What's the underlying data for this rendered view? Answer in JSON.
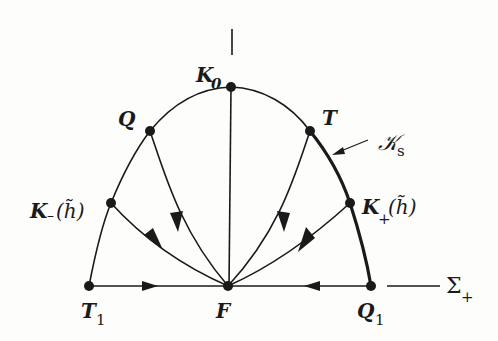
{
  "figure": {
    "colors": {
      "ink": "#1a1a1a",
      "paper": "#fdfdfc"
    },
    "nodes": [
      {
        "id": "K0",
        "label": "K",
        "sub": "0",
        "x": 231,
        "y": 87
      },
      {
        "id": "Q",
        "label": "Q",
        "sub": "",
        "x": 150,
        "y": 131
      },
      {
        "id": "T",
        "label": "T",
        "sub": "",
        "x": 310,
        "y": 131
      },
      {
        "id": "Kminus",
        "label": "K",
        "sub": "−",
        "tail": "(h̃)",
        "x": 111,
        "y": 203
      },
      {
        "id": "Kplus",
        "label": "K",
        "sub": "+",
        "tail": "(h̃)",
        "x": 350,
        "y": 203
      },
      {
        "id": "T1",
        "label": "T",
        "sub": "1",
        "x": 89,
        "y": 286
      },
      {
        "id": "F",
        "label": "F",
        "sub": "",
        "x": 228,
        "y": 286
      },
      {
        "id": "Q1",
        "label": "Q",
        "sub": "1",
        "x": 371,
        "y": 286
      }
    ],
    "labels": {
      "K0": "K",
      "K0_sub": "0",
      "Q": "Q",
      "T": "T",
      "Kminus": "K",
      "Kminus_sub": "–",
      "Kminus_tail": "(h̃)",
      "Kplus": "K",
      "Kplus_sub": "+",
      "Kplus_tail": "(h̃)",
      "T1": "T",
      "T1_sub": "1",
      "F": "F",
      "Q1": "Q",
      "Q1_sub": "1",
      "Ks": "𝒦",
      "Ks_sub": "s",
      "Sigma": "Σ",
      "Sigma_sub": "+"
    },
    "annotations": [
      {
        "text": "K_s",
        "points_to": "thick arc T–Q1"
      },
      {
        "text": "Σ_+",
        "refers_to": "horizontal line T1–Q1"
      }
    ]
  }
}
